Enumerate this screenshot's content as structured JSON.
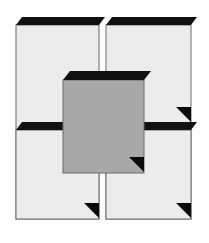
{
  "figure": {
    "width": 209,
    "height": 243,
    "background_color": "#ffffff",
    "colors": {
      "background": "#ffffff",
      "panel_fill": "#ececec",
      "panel_stroke": "#6b6b6b",
      "panel_top_face": "#111111",
      "center_fill": "#a8a8a8",
      "center_stroke": "#6b6b6b",
      "center_top_face": "#111111",
      "corner_triangle": "#0a0a0a"
    },
    "shapes": [
      {
        "id": "panel-top-left",
        "label": "Top left panel",
        "fill": "#ececec",
        "top_face": "#111111",
        "corner_triangles": 0
      },
      {
        "id": "panel-top-right",
        "label": "Top right panel",
        "fill": "#ececec",
        "top_face": "#111111",
        "corner_triangles": 1
      },
      {
        "id": "panel-bottom-left",
        "label": "Bottom left panel",
        "fill": "#ececec",
        "top_face": "#111111",
        "corner_triangles": 1
      },
      {
        "id": "panel-bottom-right",
        "label": "Bottom right panel",
        "fill": "#ececec",
        "top_face": "#111111",
        "corner_triangles": 1
      },
      {
        "id": "panel-center",
        "label": "Center overlapping square",
        "fill": "#a8a8a8",
        "top_face": "#111111",
        "corner_triangles": 1
      }
    ]
  }
}
